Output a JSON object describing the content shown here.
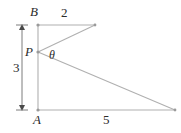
{
  "figure": {
    "kind": "geometry-diagram",
    "background_color": "#ffffff",
    "line_color": "#b0b0b0",
    "text_color": "#2b2b2b",
    "width": 181,
    "height": 133,
    "points": {
      "B": {
        "label": "B",
        "x": 38,
        "y": 25
      },
      "P": {
        "label": "P",
        "x": 38,
        "y": 52
      },
      "A": {
        "label": "A",
        "x": 38,
        "y": 110
      },
      "C": {
        "label": "",
        "x": 95,
        "y": 25
      },
      "D": {
        "label": "",
        "x": 175,
        "y": 110
      }
    },
    "segment_labels": {
      "top": "2",
      "bottom": "5",
      "left_dimension": "3"
    },
    "angle_label": "θ",
    "dimension": {
      "value": "3",
      "x": 22,
      "y_top": 25,
      "y_bottom": 110,
      "arrow": "double-headed"
    }
  }
}
